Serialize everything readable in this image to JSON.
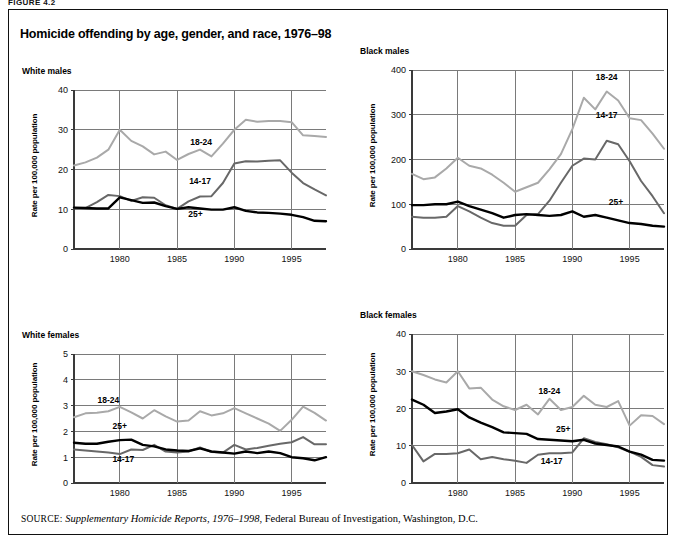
{
  "figure": {
    "number_label": "FIGURE 4.2",
    "title": "Homicide offending by age, gender, and race, 1976–98",
    "source_prefix": "SOURCE:",
    "source_italic": "Supplementary Homicide Reports, 1976–1998",
    "source_rest": ", Federal Bureau of Investigation, Washington, D.C."
  },
  "style": {
    "series_colors": {
      "18-24": "#a9a9a9",
      "14-17": "#686868",
      "25+": "#000000"
    },
    "grid_color": "#7a7a7a",
    "axis_color": "#3a3a3a",
    "frame_color": "#111111"
  },
  "common": {
    "ylabel": "Rate per 100,000 population",
    "xticks": [
      1980,
      1985,
      1990,
      1995
    ],
    "xlim": [
      1976,
      1998
    ],
    "series_names": [
      "18-24",
      "14-17",
      "25+"
    ]
  },
  "chart_data": [
    {
      "id": "white-males",
      "type": "line",
      "title": "White males",
      "xlabel": "",
      "ylabel": "Rate per 100,000 population",
      "xlim": [
        1976,
        1998
      ],
      "ylim": [
        0,
        40
      ],
      "yticks": [
        0,
        10,
        20,
        30,
        40
      ],
      "xticks": [
        1980,
        1985,
        1990,
        1995
      ],
      "grid": true,
      "legend": "inline-annotations",
      "x": [
        1976,
        1977,
        1978,
        1979,
        1980,
        1981,
        1982,
        1983,
        1984,
        1985,
        1986,
        1987,
        1988,
        1989,
        1990,
        1991,
        1992,
        1993,
        1994,
        1995,
        1996,
        1997,
        1998
      ],
      "series": [
        {
          "name": "18-24",
          "label_pos": {
            "x": 1987.1,
            "y": 26.2
          },
          "values": [
            21.0,
            21.8,
            23.0,
            25.0,
            30.0,
            27.2,
            25.8,
            23.8,
            24.5,
            22.4,
            23.9,
            25.0,
            23.3,
            26.5,
            30.0,
            32.5,
            32.0,
            32.2,
            32.2,
            31.9,
            28.6,
            28.4,
            28.2
          ]
        },
        {
          "name": "14-17",
          "label_pos": {
            "x": 1987.0,
            "y": 16.3
          },
          "values": [
            10.3,
            10.3,
            11.8,
            13.6,
            13.3,
            12.1,
            13.0,
            12.9,
            11.0,
            10.1,
            12.0,
            13.2,
            13.3,
            16.6,
            21.5,
            22.1,
            22.0,
            22.2,
            22.3,
            19.2,
            16.6,
            15.0,
            13.5
          ]
        },
        {
          "name": "25+",
          "label_pos": {
            "x": 1986.6,
            "y": 8.1
          },
          "values": [
            10.4,
            10.3,
            10.2,
            10.2,
            13.0,
            12.3,
            11.6,
            11.7,
            10.8,
            10.1,
            10.5,
            10.2,
            9.9,
            9.9,
            10.5,
            9.6,
            9.2,
            9.1,
            8.9,
            8.6,
            8.0,
            7.1,
            7.0
          ]
        }
      ]
    },
    {
      "id": "black-males",
      "type": "line",
      "title": "Black males",
      "xlabel": "",
      "ylabel": "Rate per 100,000 population",
      "xlim": [
        1976,
        1998
      ],
      "ylim": [
        0,
        400
      ],
      "yticks": [
        0,
        100,
        200,
        300,
        400
      ],
      "xticks": [
        1980,
        1985,
        1990,
        1995
      ],
      "grid": true,
      "legend": "inline-annotations",
      "x": [
        1976,
        1977,
        1978,
        1979,
        1980,
        1981,
        1982,
        1983,
        1984,
        1985,
        1986,
        1987,
        1988,
        1989,
        1990,
        1991,
        1992,
        1993,
        1994,
        1995,
        1996,
        1997,
        1998
      ],
      "series": [
        {
          "name": "18-24",
          "label_pos": {
            "x": 1993.0,
            "y": 378
          },
          "values": [
            168,
            156,
            160,
            180,
            204,
            186,
            180,
            166,
            148,
            128,
            138,
            148,
            178,
            212,
            268,
            338,
            312,
            352,
            332,
            292,
            288,
            258,
            224
          ]
        },
        {
          "name": "14-17",
          "label_pos": {
            "x": 1993.0,
            "y": 292
          },
          "values": [
            72,
            70,
            70,
            72,
            96,
            84,
            70,
            58,
            52,
            52,
            76,
            78,
            108,
            148,
            186,
            202,
            200,
            242,
            234,
            196,
            152,
            118,
            80
          ]
        },
        {
          "name": "25+",
          "label_pos": {
            "x": 1993.8,
            "y": 98
          },
          "values": [
            98,
            98,
            100,
            100,
            106,
            96,
            88,
            80,
            70,
            76,
            78,
            76,
            74,
            76,
            84,
            72,
            76,
            70,
            64,
            58,
            56,
            52,
            50
          ]
        }
      ]
    },
    {
      "id": "white-females",
      "type": "line",
      "title": "White females",
      "xlabel": "",
      "ylabel": "Rate per 100,000 population",
      "xlim": [
        1976,
        1998
      ],
      "ylim": [
        0,
        5
      ],
      "yticks": [
        0,
        1,
        2,
        3,
        4,
        5
      ],
      "xticks": [
        1980,
        1985,
        1990,
        1995
      ],
      "grid": true,
      "legend": "inline-annotations",
      "x": [
        1976,
        1977,
        1978,
        1979,
        1980,
        1981,
        1982,
        1983,
        1984,
        1985,
        1986,
        1987,
        1988,
        1989,
        1990,
        1991,
        1992,
        1993,
        1994,
        1995,
        1996,
        1997,
        1998
      ],
      "series": [
        {
          "name": "18-24",
          "label_pos": {
            "x": 1979.0,
            "y": 3.1
          },
          "values": [
            2.55,
            2.7,
            2.72,
            2.78,
            2.95,
            2.74,
            2.5,
            2.82,
            2.58,
            2.38,
            2.42,
            2.78,
            2.62,
            2.7,
            2.9,
            2.7,
            2.5,
            2.3,
            2.02,
            2.45,
            2.96,
            2.72,
            2.42
          ]
        },
        {
          "name": "14-17",
          "label_pos": {
            "x": 1980.3,
            "y": 0.8
          },
          "values": [
            1.3,
            1.26,
            1.22,
            1.18,
            1.12,
            1.3,
            1.28,
            1.48,
            1.22,
            1.18,
            1.22,
            1.38,
            1.2,
            1.18,
            1.48,
            1.3,
            1.36,
            1.44,
            1.52,
            1.58,
            1.78,
            1.5,
            1.5
          ]
        },
        {
          "name": "25+",
          "label_pos": {
            "x": 1980.0,
            "y": 2.08
          },
          "values": [
            1.56,
            1.52,
            1.52,
            1.6,
            1.66,
            1.68,
            1.48,
            1.42,
            1.3,
            1.26,
            1.24,
            1.34,
            1.22,
            1.18,
            1.14,
            1.22,
            1.16,
            1.22,
            1.16,
            1.0,
            0.96,
            0.88,
            1.0
          ]
        }
      ]
    },
    {
      "id": "black-females",
      "type": "line",
      "title": "Black females",
      "xlabel": "",
      "ylabel": "Rate per 100,000 population",
      "xlim": [
        1976,
        1998
      ],
      "ylim": [
        0,
        40
      ],
      "yticks": [
        0,
        10,
        20,
        30,
        40
      ],
      "xticks": [
        1980,
        1985,
        1990,
        1995
      ],
      "grid": true,
      "legend": "inline-annotations",
      "x": [
        1976,
        1977,
        1978,
        1979,
        1980,
        1981,
        1982,
        1983,
        1984,
        1985,
        1986,
        1987,
        1988,
        1989,
        1990,
        1991,
        1992,
        1993,
        1994,
        1995,
        1996,
        1997,
        1998
      ],
      "series": [
        {
          "name": "18-24",
          "label_pos": {
            "x": 1988.0,
            "y": 23.8
          },
          "values": [
            30.0,
            29.0,
            27.8,
            27.0,
            30.0,
            25.4,
            25.6,
            22.4,
            20.6,
            19.6,
            21.0,
            18.4,
            22.6,
            19.6,
            20.4,
            23.4,
            21.0,
            20.4,
            22.0,
            15.4,
            18.2,
            18.0,
            15.8
          ]
        },
        {
          "name": "14-17",
          "label_pos": {
            "x": 1988.2,
            "y": 5.0
          },
          "values": [
            10.2,
            5.8,
            7.8,
            7.8,
            8.0,
            9.0,
            6.4,
            7.0,
            6.4,
            6.0,
            5.4,
            7.6,
            8.0,
            8.0,
            8.2,
            12.0,
            11.0,
            10.4,
            9.6,
            8.4,
            7.0,
            4.8,
            4.4
          ]
        },
        {
          "name": "25+",
          "label_pos": {
            "x": 1989.2,
            "y": 13.6
          },
          "values": [
            22.4,
            21.0,
            18.8,
            19.2,
            19.8,
            17.6,
            16.2,
            15.0,
            13.6,
            13.4,
            13.2,
            11.8,
            11.6,
            11.4,
            11.2,
            11.6,
            10.6,
            10.2,
            9.8,
            8.4,
            7.6,
            6.2,
            6.0
          ]
        }
      ]
    }
  ]
}
